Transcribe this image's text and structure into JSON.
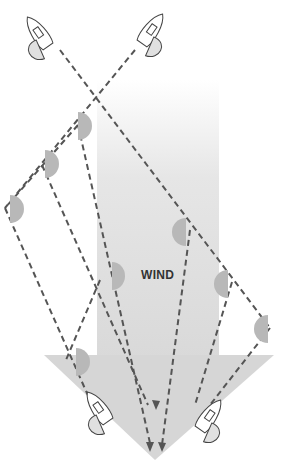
{
  "diagram": {
    "label": "WIND",
    "colors": {
      "arrow": "#d9d9d9",
      "arrow_top": "#f4f4f4",
      "path_line": "#555555",
      "sail_marker": "#b8b8b8",
      "boat_line": "#444444"
    },
    "arrow_icon": "wind-arrow-down",
    "boats": [
      {
        "id": "top-left-boat",
        "position": "top-left"
      },
      {
        "id": "top-right-boat",
        "position": "top-right"
      },
      {
        "id": "bottom-left-boat",
        "position": "bottom-left"
      },
      {
        "id": "bottom-right-boat",
        "position": "bottom-right"
      }
    ]
  }
}
